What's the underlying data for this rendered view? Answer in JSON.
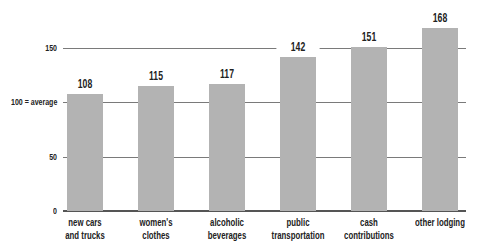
{
  "chart_data": {
    "type": "bar",
    "title": "",
    "xlabel": "",
    "ylabel": "",
    "categories": [
      [
        "new cars",
        "and trucks"
      ],
      [
        "women's clothes"
      ],
      [
        "alcoholic",
        "beverages"
      ],
      [
        "public",
        "transportation"
      ],
      [
        "cash",
        "contributions"
      ],
      [
        "other lodging"
      ]
    ],
    "values": [
      108,
      115,
      117,
      142,
      151,
      168
    ],
    "value_labels": [
      "108",
      "115",
      "117",
      "142",
      "151",
      "168"
    ],
    "yticks": [
      {
        "value": 0,
        "label": "0"
      },
      {
        "value": 50,
        "label": "50"
      },
      {
        "value": 100,
        "label": "100 = average"
      },
      {
        "value": 150,
        "label": "150"
      }
    ],
    "ylim": [
      0,
      170
    ],
    "grid": true,
    "bar_color": "#b3b3b3"
  }
}
